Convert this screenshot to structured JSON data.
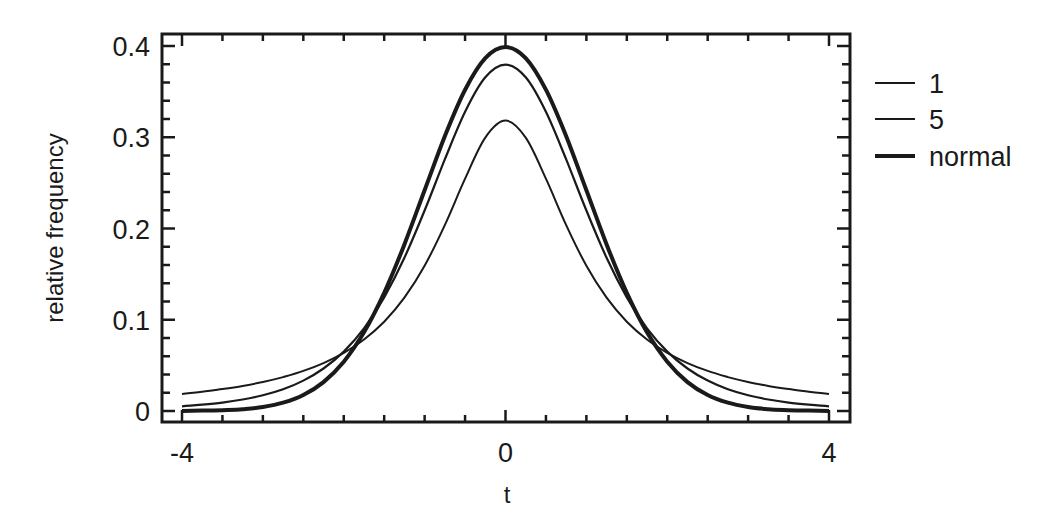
{
  "chart_data": {
    "type": "line",
    "title": "",
    "xlabel": "t",
    "ylabel": "relative frequency",
    "xlim": [
      -4,
      4
    ],
    "ylim": [
      0,
      0.4
    ],
    "xticks": [
      -4,
      0,
      4
    ],
    "xtick_labels": [
      "-4",
      "0",
      "4"
    ],
    "xminor_step": 0.5,
    "yticks": [
      0,
      0.1,
      0.2,
      0.3,
      0.4
    ],
    "ytick_labels": [
      "0",
      "0.1",
      "0.2",
      "0.3",
      "0.4"
    ],
    "yminor_step": 0.02,
    "grid": false,
    "legend_position": "right-outside-top",
    "x": [
      -4,
      -3.75,
      -3.5,
      -3.25,
      -3,
      -2.75,
      -2.5,
      -2.25,
      -2,
      -1.75,
      -1.5,
      -1.25,
      -1,
      -0.75,
      -0.5,
      -0.25,
      0,
      0.25,
      0.5,
      0.75,
      1,
      1.25,
      1.5,
      1.75,
      2,
      2.25,
      2.5,
      2.75,
      3,
      3.25,
      3.5,
      3.75,
      4
    ],
    "series": [
      {
        "name": "1",
        "line_width": 2,
        "values": [
          0.0187,
          0.0212,
          0.024,
          0.0275,
          0.0318,
          0.0372,
          0.0439,
          0.0525,
          0.0637,
          0.0784,
          0.0979,
          0.1242,
          0.1592,
          0.2037,
          0.2546,
          0.2996,
          0.3183,
          0.2996,
          0.2546,
          0.2037,
          0.1592,
          0.1242,
          0.0979,
          0.0784,
          0.0637,
          0.0525,
          0.0439,
          0.0372,
          0.0318,
          0.0275,
          0.024,
          0.0212,
          0.0187
        ]
      },
      {
        "name": "5",
        "line_width": 2.2,
        "values": [
          0.0051,
          0.0069,
          0.0092,
          0.0126,
          0.0173,
          0.0239,
          0.0333,
          0.0466,
          0.0651,
          0.0905,
          0.1245,
          0.1679,
          0.2197,
          0.2757,
          0.3279,
          0.3657,
          0.3796,
          0.3657,
          0.3279,
          0.2757,
          0.2197,
          0.1679,
          0.1245,
          0.0905,
          0.0651,
          0.0466,
          0.0333,
          0.0239,
          0.0173,
          0.0126,
          0.0092,
          0.0069,
          0.0051
        ]
      },
      {
        "name": "normal",
        "line_width": 4,
        "values": [
          0.0001,
          0.0004,
          0.0009,
          0.002,
          0.0044,
          0.0091,
          0.0175,
          0.0317,
          0.054,
          0.0863,
          0.1295,
          0.1826,
          0.242,
          0.3011,
          0.3521,
          0.3867,
          0.3989,
          0.3867,
          0.3521,
          0.3011,
          0.242,
          0.1826,
          0.1295,
          0.0863,
          0.054,
          0.0317,
          0.0175,
          0.0091,
          0.0044,
          0.002,
          0.0009,
          0.0004,
          0.0001
        ]
      }
    ]
  },
  "colors": {
    "line": "#1a1a1a",
    "background": "#ffffff"
  }
}
